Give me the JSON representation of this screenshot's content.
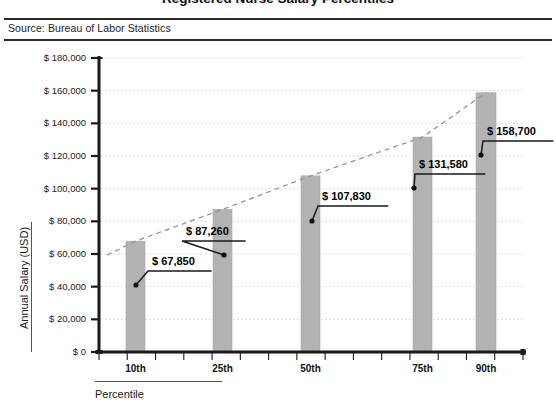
{
  "header": {
    "title": "Registered Nurse Salary Percentiles",
    "source": "Source: Bureau of Labor Statistics"
  },
  "chart_data": {
    "type": "bar",
    "title": "Registered Nurse Salary Percentiles",
    "xlabel": "Percentile",
    "ylabel": "Annual Salary (USD)",
    "categories": [
      "10th",
      "25th",
      "50th",
      "75th",
      "90th"
    ],
    "values": [
      67850,
      87260,
      107830,
      131580,
      158700
    ],
    "data_labels": [
      "$ 67,850",
      "$ 87,260",
      "$ 107,830",
      "$ 131,580",
      "$ 158,700"
    ],
    "ylim": [
      0,
      180000
    ],
    "ytick_values": [
      0,
      20000,
      40000,
      60000,
      80000,
      100000,
      120000,
      140000,
      160000,
      180000
    ],
    "ytick_labels": [
      "$ 0",
      "$ 20,000",
      "$ 40,000",
      "$ 60,000",
      "$ 80,000",
      "$ 100,000",
      "$ 120,000",
      "$ 140,000",
      "$ 160,000",
      "$ 180,000"
    ],
    "grid": true,
    "legend": "none",
    "series": [
      {
        "name": "Annual Salary",
        "values": [
          67850,
          87260,
          107830,
          131580,
          158700
        ],
        "color": "#b3b3b3"
      },
      {
        "name": "Trend",
        "type": "line",
        "style": "dashed",
        "color": "#9a9a9a",
        "values": [
          67850,
          87260,
          107830,
          131580,
          158700
        ]
      }
    ]
  },
  "colors": {
    "bar": "#b3b3b3",
    "bar_edge": "#a8a8a8",
    "trend": "#9a9a9a",
    "axis": "#1a1a1a",
    "grid": "#cfcfcf",
    "rule": "#2b2b2b"
  }
}
